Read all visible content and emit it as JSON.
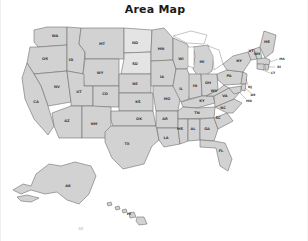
{
  "figure": {
    "title": "Area Map",
    "background_color": "#ffffff",
    "state_fill_color": "#d2d2d2",
    "state_fill_light_color": "#e4e4e4",
    "state_border_color": "#6e6e6e",
    "label_color": "#3a3a3a",
    "lake_fill_color": "#ffffff"
  },
  "map": {
    "type": "choropleth-outline",
    "region": "United States",
    "includes_insets": [
      "Alaska",
      "Hawaii"
    ],
    "states": [
      {
        "code": "WA",
        "x": 54,
        "y": 22,
        "shade": "normal"
      },
      {
        "code": "OR",
        "x": 44,
        "y": 45,
        "shade": "normal"
      },
      {
        "code": "ID",
        "x": 70,
        "y": 46,
        "shade": "normal"
      },
      {
        "code": "MT",
        "x": 101,
        "y": 30,
        "shade": "normal"
      },
      {
        "code": "WY",
        "x": 99,
        "y": 59,
        "shade": "normal"
      },
      {
        "code": "NV",
        "x": 56,
        "y": 73,
        "shade": "normal"
      },
      {
        "code": "UT",
        "x": 78,
        "y": 78,
        "shade": "normal"
      },
      {
        "code": "CA",
        "x": 35,
        "y": 88,
        "shade": "normal"
      },
      {
        "code": "CO",
        "x": 104,
        "y": 80,
        "shade": "normal"
      },
      {
        "code": "AZ",
        "x": 66,
        "y": 107,
        "shade": "normal"
      },
      {
        "code": "NM",
        "x": 93,
        "y": 110,
        "shade": "normal"
      },
      {
        "code": "ND",
        "x": 134,
        "y": 29,
        "shade": "light"
      },
      {
        "code": "SD",
        "x": 134,
        "y": 50,
        "shade": "light"
      },
      {
        "code": "NE",
        "x": 134,
        "y": 70,
        "shade": "normal"
      },
      {
        "code": "KS",
        "x": 137,
        "y": 88,
        "shade": "normal"
      },
      {
        "code": "OK",
        "x": 138,
        "y": 105,
        "shade": "normal"
      },
      {
        "code": "TX",
        "x": 126,
        "y": 130,
        "shade": "normal"
      },
      {
        "code": "MN",
        "x": 160,
        "y": 35,
        "shade": "normal"
      },
      {
        "code": "IA",
        "x": 161,
        "y": 63,
        "shade": "normal"
      },
      {
        "code": "MO",
        "x": 166,
        "y": 85,
        "shade": "normal"
      },
      {
        "code": "AR",
        "x": 164,
        "y": 105,
        "shade": "normal"
      },
      {
        "code": "LA",
        "x": 165,
        "y": 124,
        "shade": "normal"
      },
      {
        "code": "WI",
        "x": 180,
        "y": 45,
        "shade": "normal"
      },
      {
        "code": "IL",
        "x": 180,
        "y": 75,
        "shade": "normal"
      },
      {
        "code": "MI",
        "x": 201,
        "y": 48,
        "shade": "normal"
      },
      {
        "code": "IN",
        "x": 194,
        "y": 72,
        "shade": "normal"
      },
      {
        "code": "OH",
        "x": 207,
        "y": 69,
        "shade": "normal"
      },
      {
        "code": "KY",
        "x": 201,
        "y": 87,
        "shade": "normal"
      },
      {
        "code": "TN",
        "x": 196,
        "y": 99,
        "shade": "normal"
      },
      {
        "code": "MS",
        "x": 179,
        "y": 115,
        "shade": "normal"
      },
      {
        "code": "AL",
        "x": 192,
        "y": 115,
        "shade": "normal"
      },
      {
        "code": "GA",
        "x": 206,
        "y": 115,
        "shade": "normal"
      },
      {
        "code": "FL",
        "x": 220,
        "y": 137,
        "shade": "normal"
      },
      {
        "code": "SC",
        "x": 217,
        "y": 104,
        "shade": "normal"
      },
      {
        "code": "NC",
        "x": 222,
        "y": 94,
        "shade": "normal"
      },
      {
        "code": "VA",
        "x": 224,
        "y": 82,
        "shade": "normal"
      },
      {
        "code": "WV",
        "x": 213,
        "y": 77,
        "shade": "normal"
      },
      {
        "code": "PA",
        "x": 228,
        "y": 62,
        "shade": "normal"
      },
      {
        "code": "NY",
        "x": 238,
        "y": 47,
        "shade": "normal"
      },
      {
        "code": "ME",
        "x": 266,
        "y": 28,
        "shade": "normal"
      },
      {
        "code": "VT",
        "x": 250,
        "y": 37,
        "shade": "normal"
      },
      {
        "code": "NH",
        "x": 256,
        "y": 40,
        "shade": "normal"
      }
    ],
    "callout_states": [
      {
        "code": "MA",
        "x": 281,
        "y": 45,
        "lx": 262,
        "ly": 48
      },
      {
        "code": "RI",
        "x": 278,
        "y": 53,
        "lx": 264,
        "ly": 52
      },
      {
        "code": "CT",
        "x": 272,
        "y": 59,
        "lx": 259,
        "ly": 54
      },
      {
        "code": "NJ",
        "x": 249,
        "y": 73,
        "lx": 241,
        "ly": 68
      },
      {
        "code": "DE",
        "x": 252,
        "y": 81,
        "lx": 240,
        "ly": 74
      },
      {
        "code": "MD",
        "x": 248,
        "y": 87,
        "lx": 235,
        "ly": 78
      }
    ],
    "inset_states": [
      {
        "code": "AK",
        "x": 67,
        "y": 172
      },
      {
        "code": "HI",
        "x": 128,
        "y": 200
      }
    ],
    "watermark_text": "AK"
  }
}
